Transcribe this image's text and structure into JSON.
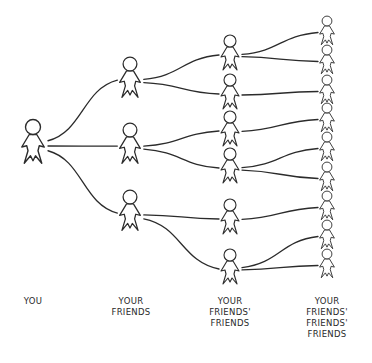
{
  "diagram": {
    "ink_color": "#2b2b2b",
    "background": "#ffffff",
    "levels": [
      {
        "id": "you",
        "label_lines": [
          "YOU"
        ],
        "count": 1
      },
      {
        "id": "friends",
        "label_lines": [
          "YOUR",
          "FRIENDS"
        ],
        "count": 3
      },
      {
        "id": "friends-friends",
        "label_lines": [
          "YOUR",
          "FRIENDS'",
          "FRIENDS"
        ],
        "count": 6
      },
      {
        "id": "friends-friends-friends",
        "label_lines": [
          "YOUR",
          "FRIENDS'",
          "FRIENDS'",
          "FRIENDS"
        ],
        "count": 9
      }
    ],
    "edges": [
      {
        "from": [
          0,
          0
        ],
        "to": [
          1,
          0
        ]
      },
      {
        "from": [
          0,
          0
        ],
        "to": [
          1,
          1
        ]
      },
      {
        "from": [
          0,
          0
        ],
        "to": [
          1,
          2
        ]
      },
      {
        "from": [
          1,
          0
        ],
        "to": [
          2,
          0
        ]
      },
      {
        "from": [
          1,
          0
        ],
        "to": [
          2,
          1
        ]
      },
      {
        "from": [
          1,
          1
        ],
        "to": [
          2,
          2
        ]
      },
      {
        "from": [
          1,
          1
        ],
        "to": [
          2,
          3
        ]
      },
      {
        "from": [
          1,
          2
        ],
        "to": [
          2,
          4
        ]
      },
      {
        "from": [
          1,
          2
        ],
        "to": [
          2,
          5
        ]
      },
      {
        "from": [
          2,
          0
        ],
        "to": [
          3,
          0
        ]
      },
      {
        "from": [
          2,
          0
        ],
        "to": [
          3,
          1
        ]
      },
      {
        "from": [
          2,
          1
        ],
        "to": [
          3,
          2
        ]
      },
      {
        "from": [
          2,
          2
        ],
        "to": [
          3,
          3
        ]
      },
      {
        "from": [
          2,
          3
        ],
        "to": [
          3,
          4
        ]
      },
      {
        "from": [
          2,
          3
        ],
        "to": [
          3,
          5
        ]
      },
      {
        "from": [
          2,
          4
        ],
        "to": [
          3,
          6
        ]
      },
      {
        "from": [
          2,
          5
        ],
        "to": [
          3,
          7
        ]
      },
      {
        "from": [
          2,
          5
        ],
        "to": [
          3,
          8
        ]
      }
    ]
  }
}
